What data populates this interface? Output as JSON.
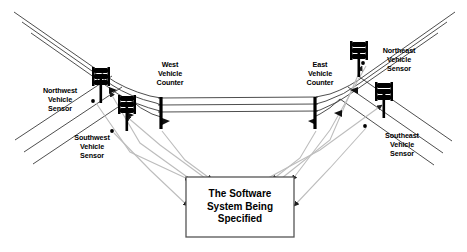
{
  "diagram": {
    "system_box": {
      "label": "The Software\nSystem Being\nSpecified",
      "x": 186,
      "y": 177,
      "width": 108,
      "height": 60,
      "border_color": "#000000",
      "fill_color": "#ffffff"
    },
    "sensors": [
      {
        "id": "northwest-vehicle-sensor",
        "label": "Northwest\nVehicle\nSensor",
        "x": 30,
        "y": 86,
        "width": 60,
        "marker_x": 93,
        "marker_y": 101
      },
      {
        "id": "southwest-vehicle-sensor",
        "label": "Southwest\nVehicle\nSensor",
        "x": 62,
        "y": 133,
        "width": 60,
        "marker_x": 112,
        "marker_y": 131
      },
      {
        "id": "northeast-vehicle-sensor",
        "label": "Northeast\nVehicle\nSensor",
        "x": 369,
        "y": 46,
        "width": 60,
        "marker_x": 363,
        "marker_y": 63
      },
      {
        "id": "southeast-vehicle-sensor",
        "label": "Southeast\nVehicle\nSensor",
        "x": 372,
        "y": 131,
        "width": 60,
        "marker_x": 365,
        "marker_y": 126
      }
    ],
    "counters": [
      {
        "id": "west-vehicle-counter",
        "label": "West\nVehicle\nCounter",
        "x": 141,
        "y": 60,
        "width": 58,
        "bar_x": 161,
        "bar_top": 97,
        "bar_bottom": 129
      },
      {
        "id": "east-vehicle-counter",
        "label": "East\nVehicle\nCounter",
        "x": 291,
        "y": 60,
        "width": 58,
        "bar_x": 315,
        "bar_top": 97,
        "bar_bottom": 129
      }
    ],
    "traffic_lights": [
      {
        "id": "traffic-light-northwest",
        "x": 94,
        "y": 70
      },
      {
        "id": "traffic-light-southwest",
        "x": 120,
        "y": 98
      },
      {
        "id": "traffic-light-northeast",
        "x": 352,
        "y": 44
      },
      {
        "id": "traffic-light-southeast",
        "x": 377,
        "y": 85
      }
    ],
    "colors": {
      "line": "#000000",
      "road": "#3a3a3a",
      "flow_arrow": "#b8b8b8",
      "text": "#000000"
    }
  }
}
